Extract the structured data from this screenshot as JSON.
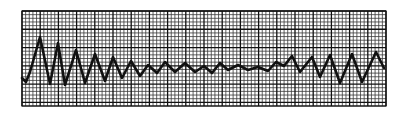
{
  "figure": {
    "label": "ECG rhythm strip"
  },
  "grid": {
    "x": 22,
    "y": 11,
    "width": 364,
    "height": 95,
    "minor_step": 3.64,
    "major_every": 5,
    "minor_color": "#3a3a3a",
    "major_color": "#111111",
    "background": "#ffffff"
  },
  "trace": {
    "color": "#111111",
    "stroke_width": 2.6,
    "points": [
      [
        22,
        78
      ],
      [
        26,
        82
      ],
      [
        30,
        72
      ],
      [
        40,
        37
      ],
      [
        50,
        84
      ],
      [
        58,
        43
      ],
      [
        65,
        85
      ],
      [
        76,
        50
      ],
      [
        85,
        83
      ],
      [
        95,
        54
      ],
      [
        105,
        81
      ],
      [
        113,
        57
      ],
      [
        122,
        78
      ],
      [
        131,
        61
      ],
      [
        140,
        76
      ],
      [
        148,
        65
      ],
      [
        157,
        73
      ],
      [
        165,
        62
      ],
      [
        175,
        72
      ],
      [
        185,
        63
      ],
      [
        195,
        72
      ],
      [
        204,
        66
      ],
      [
        212,
        73
      ],
      [
        220,
        63
      ],
      [
        228,
        70
      ],
      [
        238,
        65
      ],
      [
        248,
        70
      ],
      [
        258,
        67
      ],
      [
        268,
        71
      ],
      [
        276,
        62
      ],
      [
        284,
        66
      ],
      [
        292,
        56
      ],
      [
        300,
        72
      ],
      [
        312,
        57
      ],
      [
        320,
        77
      ],
      [
        330,
        55
      ],
      [
        340,
        83
      ],
      [
        352,
        54
      ],
      [
        362,
        82
      ],
      [
        376,
        52
      ],
      [
        384,
        68
      ]
    ]
  }
}
